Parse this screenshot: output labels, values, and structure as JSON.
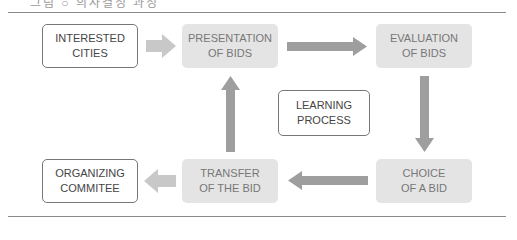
{
  "header": {
    "clipped_caption": "그림 ○ 의사결정 과정"
  },
  "diagram": {
    "nodes": [
      {
        "id": "interested-cities",
        "label": "INTERESTED\nCITIES",
        "style": "outline"
      },
      {
        "id": "presentation-of-bids",
        "label": "PRESENTATION\nOF BIDS",
        "style": "filled"
      },
      {
        "id": "evaluation-of-bids",
        "label": "EVALUATION\nOF BIDS",
        "style": "filled"
      },
      {
        "id": "learning-process",
        "label": "LEARNING\nPROCESS",
        "style": "outline"
      },
      {
        "id": "choice-of-a-bid",
        "label": "CHOICE\nOF A BID",
        "style": "filled"
      },
      {
        "id": "transfer-of-the-bid",
        "label": "TRANSFER\nOF THE BID",
        "style": "filled"
      },
      {
        "id": "organizing-commitee",
        "label": "ORGANIZING\nCOMMITEE",
        "style": "outline"
      }
    ],
    "edges": [
      {
        "from": "interested-cities",
        "to": "presentation-of-bids",
        "color": "#c8c8c8"
      },
      {
        "from": "presentation-of-bids",
        "to": "evaluation-of-bids",
        "color": "#9e9e9e"
      },
      {
        "from": "evaluation-of-bids",
        "to": "choice-of-a-bid",
        "color": "#9e9e9e"
      },
      {
        "from": "choice-of-a-bid",
        "to": "transfer-of-the-bid",
        "color": "#9e9e9e"
      },
      {
        "from": "transfer-of-the-bid",
        "to": "presentation-of-bids",
        "color": "#9e9e9e"
      },
      {
        "from": "transfer-of-the-bid",
        "to": "organizing-commitee",
        "color": "#c8c8c8"
      }
    ]
  },
  "colors": {
    "dark_arrow": "#9e9e9e",
    "light_arrow": "#c8c8c8",
    "filled_box": "#e4e4e4",
    "rule_line": "#8a8a8a"
  }
}
